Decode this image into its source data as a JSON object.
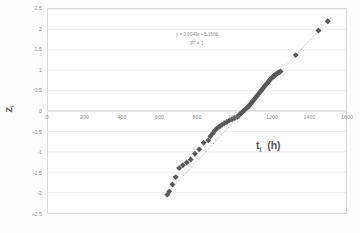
{
  "chart_data": {
    "type": "scatter",
    "title": "",
    "xlabel": "t i  (h)",
    "xlabel_base": "t",
    "xlabel_sub": "i",
    "xlabel_unit": "(h)",
    "ylabel": "Z i",
    "ylabel_base": "Z",
    "ylabel_sub": "i",
    "xlim": [
      0,
      1600
    ],
    "ylim": [
      -2.5,
      2.5
    ],
    "xticks": [
      0,
      200,
      400,
      600,
      800,
      1000,
      1200,
      1400,
      1600
    ],
    "xtick_labels": [
      "0",
      "200",
      "400",
      "600",
      "800",
      "1000",
      "1200",
      "1400",
      "1600"
    ],
    "yticks": [
      2.5,
      2,
      1.5,
      1,
      0.5,
      0,
      -0.5,
      -1,
      -1.5,
      -2,
      -2.5
    ],
    "ytick_labels": [
      "2.5",
      "2",
      "1.5",
      "1",
      "0.5",
      "0",
      "-0.5",
      "-1",
      "-1.5",
      "-2",
      "-2.5"
    ],
    "grid": "horizontal",
    "legend": "none",
    "marker": "diamond",
    "marker_color": "#595959",
    "marker_size": 3.0,
    "trendline": {
      "visible": true,
      "style": "dotted",
      "color": "#808080",
      "slope": 0.0049,
      "intercept": -5.1508,
      "equation": "y = 0.0049x - 5.1508",
      "r_squared_label": "R² = 1",
      "r_squared_value": 1
    },
    "x": [
      641,
      651,
      668,
      686,
      704,
      724,
      745,
      766,
      789,
      812,
      836,
      861,
      872,
      884,
      896,
      908,
      921,
      934,
      947,
      960,
      974,
      988,
      1002,
      1016,
      1024,
      1031,
      1038,
      1045,
      1052,
      1059,
      1066,
      1073,
      1080,
      1087,
      1094,
      1101,
      1108,
      1115,
      1122,
      1129,
      1136,
      1143,
      1150,
      1157,
      1164,
      1171,
      1178,
      1185,
      1192,
      1199,
      1206,
      1213,
      1220,
      1227,
      1234,
      1241,
      1248,
      1330,
      1452,
      1502
    ],
    "y": [
      -2.05,
      -1.97,
      -1.8,
      -1.62,
      -1.4,
      -1.33,
      -1.26,
      -1.19,
      -1.05,
      -0.94,
      -0.78,
      -0.72,
      -0.62,
      -0.55,
      -0.48,
      -0.42,
      -0.38,
      -0.34,
      -0.3,
      -0.27,
      -0.23,
      -0.2,
      -0.17,
      -0.14,
      -0.11,
      -0.08,
      -0.05,
      -0.02,
      0.01,
      0.04,
      0.07,
      0.1,
      0.13,
      0.17,
      0.21,
      0.25,
      0.29,
      0.33,
      0.37,
      0.41,
      0.45,
      0.49,
      0.53,
      0.57,
      0.61,
      0.65,
      0.69,
      0.73,
      0.77,
      0.8,
      0.83,
      0.86,
      0.89,
      0.91,
      0.93,
      0.95,
      0.97,
      1.37,
      1.97,
      2.2
    ]
  }
}
